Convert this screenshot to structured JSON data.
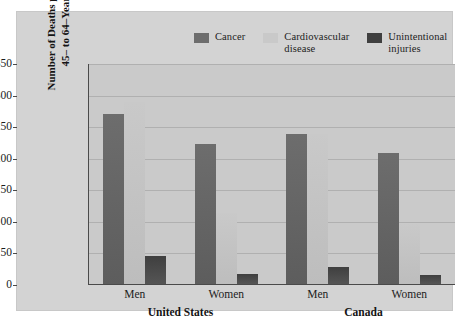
{
  "chart_data": {
    "type": "bar",
    "title": "",
    "subtitle": "",
    "xlabel": "",
    "ylabel": "Number of Deaths per 100,000\n45– to 64–Year-Olds",
    "ylim": [
      0,
      350
    ],
    "yticks": [
      0,
      50,
      100,
      150,
      200,
      250,
      300,
      350
    ],
    "grid": true,
    "legend_position": "top",
    "categories": [
      "Men",
      "Women",
      "Men",
      "Women"
    ],
    "group_labels": [
      "United States",
      "Canada"
    ],
    "series": [
      {
        "name": "Cancer",
        "color": "#6d6d6d",
        "values": [
          270,
          222,
          238,
          208
        ]
      },
      {
        "name": "Cardiovascular disease",
        "color": "#c9c9c9",
        "values": [
          288,
          113,
          238,
          95
        ]
      },
      {
        "name": "Unintentional injuries",
        "color": "#3f3f3f",
        "values": [
          44,
          16,
          27,
          14
        ]
      }
    ]
  },
  "legend": {
    "items": [
      {
        "label": "Cancer",
        "color": "#6d6d6d"
      },
      {
        "label": "Cardiovascular\ndisease",
        "color": "#c9c9c9"
      },
      {
        "label": "Unintentional\ninjuries",
        "color": "#3f3f3f"
      }
    ]
  },
  "axis": {
    "y_title": "Number of Deaths per 100,000\n45– to 64–Year-Olds",
    "y_tick_labels": [
      "350",
      "300",
      "250",
      "200",
      "150",
      "100",
      "50",
      "0"
    ]
  },
  "x_axis": {
    "tick_labels": [
      "Men",
      "Women",
      "Men",
      "Women"
    ],
    "group_labels": [
      "United States",
      "Canada"
    ]
  },
  "colors": {
    "page_background": "#ffffff",
    "panel_background": "#d3d3d3",
    "plot_background": "#cacaca",
    "axis_line": "#4a4a4a",
    "gridline": "#b0b0b0",
    "text": "#1c1c1c"
  }
}
